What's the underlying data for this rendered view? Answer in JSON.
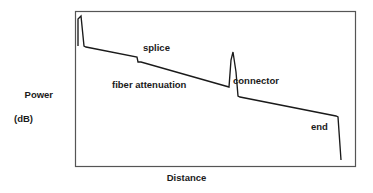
{
  "figure": {
    "name": "otdr-trace-diagram",
    "background_color": "#ffffff",
    "line_color": "#1a1a1a",
    "frame_color": "#555555"
  },
  "axes": {
    "y_label_line1": "Power",
    "y_label_line2": "(dB)",
    "x_label": "Distance"
  },
  "annotations": [
    {
      "key": "splice",
      "text": "splice"
    },
    {
      "key": "fiber",
      "text": "fiber attenuation"
    },
    {
      "key": "connector",
      "text": "connector"
    },
    {
      "key": "end",
      "text": "end"
    }
  ],
  "chart_data": {
    "type": "line",
    "title": "",
    "xlabel": "Distance",
    "ylabel": "Power (dB)",
    "grid": false,
    "legend": null,
    "xlim": [
      0,
      100
    ],
    "ylim": [
      0,
      100
    ],
    "axis_ticks": {
      "x": [],
      "y": []
    },
    "plot_frame": {
      "x0": 75,
      "y0": 11,
      "x1": 355,
      "y1": 166
    },
    "series": [
      {
        "name": "OTDR backscatter trace",
        "points": [
          [
            78,
            46
          ],
          [
            78,
            19
          ],
          [
            81,
            16
          ],
          [
            84,
            46
          ],
          [
            86,
            47
          ],
          [
            137,
            57
          ],
          [
            138,
            62
          ],
          [
            141,
            62
          ],
          [
            229,
            87
          ],
          [
            231,
            60
          ],
          [
            233,
            52
          ],
          [
            236,
            72
          ],
          [
            238,
            96
          ],
          [
            240,
            97
          ],
          [
            336,
            116
          ],
          [
            338,
            117
          ],
          [
            341,
            160
          ]
        ]
      }
    ],
    "events": [
      {
        "label": "launch reflection",
        "x": 81,
        "type": "reflective-peak"
      },
      {
        "label": "splice",
        "x": 138,
        "type": "non-reflective-loss-step"
      },
      {
        "label": "fiber attenuation",
        "x": 160,
        "type": "linear-slope"
      },
      {
        "label": "connector",
        "x": 233,
        "type": "reflective-peak-with-loss"
      },
      {
        "label": "end",
        "x": 338,
        "type": "fiber-end-drop"
      }
    ]
  }
}
